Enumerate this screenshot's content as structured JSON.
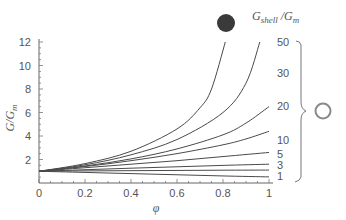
{
  "chart_data": {
    "type": "line",
    "title": "",
    "xlabel": "φ",
    "ylabel": "G/Gm",
    "ylabel_parts": {
      "main": "G/G",
      "sub": "m"
    },
    "xlim": [
      0,
      1
    ],
    "ylim": [
      0,
      12
    ],
    "xticks": [
      0,
      0.2,
      0.4,
      0.6,
      0.8,
      1
    ],
    "xtick_labels": [
      "0",
      "0.2",
      "0.4",
      "0.6",
      "0.8",
      "1"
    ],
    "yticks": [
      2,
      4,
      6,
      8,
      10,
      12
    ],
    "ytick_labels": [
      "2",
      "4",
      "6",
      "8",
      "10",
      "12"
    ],
    "grid": false,
    "legend_title": {
      "main": "G",
      "sub1": "shell",
      "mid": " /G",
      "sub2": "m"
    },
    "legend_position": "right",
    "markers": {
      "rigid": {
        "label": "filled circle (rigid particle)",
        "color": "#3a3a3a"
      },
      "shell": {
        "label": "open circle (shell particle)",
        "color": "#8a8a8a"
      }
    },
    "series": [
      {
        "name": "rigid",
        "label": "",
        "x": [
          0,
          0.2,
          0.4,
          0.6,
          0.7,
          0.75,
          0.81
        ],
        "y": [
          1,
          1.65,
          2.7,
          4.6,
          6.4,
          8.0,
          12
        ]
      },
      {
        "name": "50",
        "label": "50",
        "x": [
          0,
          0.2,
          0.4,
          0.6,
          0.8,
          0.9,
          0.96
        ],
        "y": [
          1,
          1.55,
          2.4,
          3.7,
          6.0,
          8.5,
          12
        ]
      },
      {
        "name": "30",
        "label": "30",
        "x": [
          0,
          0.2,
          0.4,
          0.6,
          0.8,
          0.9,
          1.0
        ],
        "y": [
          1,
          1.45,
          2.05,
          2.9,
          4.1,
          5.1,
          6.5
        ]
      },
      {
        "name": "20",
        "label": "20",
        "x": [
          0,
          0.2,
          0.4,
          0.6,
          0.8,
          0.9,
          1.0
        ],
        "y": [
          1,
          1.4,
          1.9,
          2.5,
          3.25,
          3.75,
          4.4
        ]
      },
      {
        "name": "10",
        "label": "10",
        "x": [
          0,
          0.2,
          0.4,
          0.6,
          0.8,
          1.0
        ],
        "y": [
          1,
          1.3,
          1.6,
          1.9,
          2.25,
          2.6
        ]
      },
      {
        "name": "5",
        "label": "5",
        "x": [
          0,
          0.2,
          0.4,
          0.6,
          0.8,
          1.0
        ],
        "y": [
          1,
          1.13,
          1.26,
          1.38,
          1.5,
          1.6
        ]
      },
      {
        "name": "3",
        "label": "3",
        "x": [
          0,
          0.2,
          0.4,
          0.6,
          0.8,
          1.0
        ],
        "y": [
          1,
          1.03,
          1.05,
          1.07,
          1.09,
          1.1
        ]
      },
      {
        "name": "1",
        "label": "1",
        "x": [
          0,
          0.2,
          0.4,
          0.6,
          0.8,
          1.0
        ],
        "y": [
          1,
          0.9,
          0.8,
          0.7,
          0.6,
          0.52
        ]
      }
    ]
  }
}
